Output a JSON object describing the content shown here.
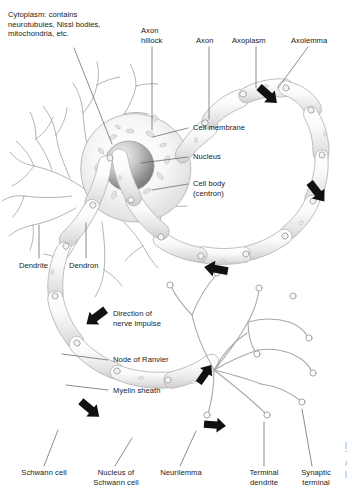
{
  "figure": {
    "background_color": "#ffffff",
    "text_color": "#1a1a1a",
    "line_color": "#6e6e6e",
    "arrow_color": "#111111"
  },
  "labels": {
    "cytoplasm": "Cytoplasm: contains\nneurotubules, Nissl bodies,\nmitochondria, etc.",
    "axon_hillock": "Axon\nhillock",
    "axon": "Axon",
    "axoplasm": "Axoplasm",
    "axolemma": "Axolemma",
    "cell_membrane": "Cell membrane",
    "nucleus": "Nucleus",
    "cell_body": "Cell body\n(centron)",
    "dendrite": "Dendrite",
    "dendron": "Dendron",
    "direction_of_nerve_impulse": "Direction of\nnerve impulse",
    "node_of_ranvier": "Node of Ranvier",
    "myelin_sheath": "Myelin sheath",
    "schwann_cell": "Schwann cell",
    "nucleus_of_schwann_cell": "Nucleus of\nSchwann cell",
    "neurilemma": "Neurilemma",
    "terminal_dendrite": "Terminal\ndendrite",
    "synaptic_terminal": "Synaptic\nterminal"
  },
  "icons": {
    "impulse_arrow": "arrow-icon"
  },
  "arrows": [
    {
      "name": "impulse-arrow-upper-right",
      "x": 268,
      "y": 95,
      "rotation": 42
    },
    {
      "name": "impulse-arrow-mid-right",
      "x": 317,
      "y": 192,
      "rotation": 52
    },
    {
      "name": "impulse-arrow-lower-right",
      "x": 216,
      "y": 269,
      "rotation": 190
    },
    {
      "name": "impulse-arrow-mid-left",
      "x": 96,
      "y": 317,
      "rotation": 143
    },
    {
      "name": "impulse-arrow-lower-left",
      "x": 90,
      "y": 409,
      "rotation": 40
    },
    {
      "name": "impulse-arrow-terminal-up",
      "x": 205,
      "y": 374,
      "rotation": -55
    },
    {
      "name": "impulse-arrow-terminal-right",
      "x": 215,
      "y": 425,
      "rotation": 5
    }
  ]
}
